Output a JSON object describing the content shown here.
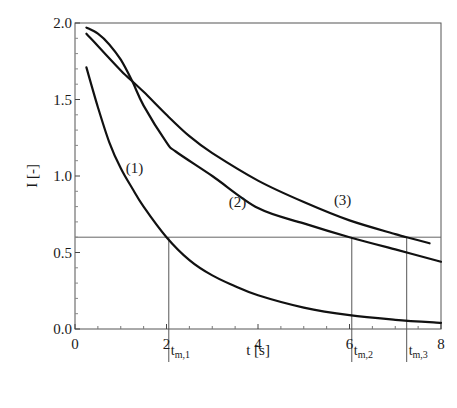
{
  "chart_data": {
    "type": "line",
    "title": "",
    "xlabel": "t [s]",
    "ylabel": "I [-]",
    "xlim": [
      0,
      8
    ],
    "ylim": [
      0,
      2.0
    ],
    "x_ticks": [
      "0",
      "2",
      "4",
      "6",
      "8"
    ],
    "y_ticks": [
      "0.0",
      "0.5",
      "1.0",
      "1.5",
      "2.0"
    ],
    "grid": false,
    "legend": "inline curve labels",
    "series": [
      {
        "name": "(1)",
        "x": [
          0.25,
          0.5,
          0.75,
          1.0,
          1.25,
          1.5,
          2.0,
          2.5,
          3.0,
          3.5,
          4.0,
          5.0,
          6.0,
          7.0,
          8.0
        ],
        "y": [
          1.71,
          1.45,
          1.22,
          1.05,
          0.92,
          0.8,
          0.6,
          0.45,
          0.35,
          0.28,
          0.22,
          0.14,
          0.09,
          0.06,
          0.04
        ]
      },
      {
        "name": "(2)",
        "x": [
          0.25,
          0.5,
          0.75,
          1.0,
          1.25,
          1.5,
          2.0,
          2.2,
          3.0,
          4.0,
          5.0,
          6.0,
          7.0,
          8.0
        ],
        "y": [
          1.97,
          1.93,
          1.86,
          1.76,
          1.62,
          1.46,
          1.22,
          1.16,
          1.0,
          0.79,
          0.69,
          0.6,
          0.52,
          0.44
        ]
      },
      {
        "name": "(3)",
        "x": [
          0.25,
          0.5,
          1.0,
          1.14,
          1.5,
          2.0,
          2.5,
          3.0,
          4.0,
          5.0,
          6.0,
          7.0,
          7.25,
          7.75
        ],
        "y": [
          1.93,
          1.85,
          1.69,
          1.65,
          1.55,
          1.4,
          1.26,
          1.15,
          0.97,
          0.83,
          0.71,
          0.62,
          0.6,
          0.56
        ]
      }
    ],
    "reference_line": {
      "y": 0.6,
      "orientation": "horizontal"
    },
    "markers": [
      {
        "label": "t",
        "sub": "m,1",
        "x": 2.05
      },
      {
        "label": "t",
        "sub": "m,2",
        "x": 6.05
      },
      {
        "label": "t",
        "sub": "m,3",
        "x": 7.25
      }
    ],
    "annotations": [
      {
        "text": "(1)",
        "x": 1.3,
        "y": 1.02
      },
      {
        "text": "(2)",
        "x": 3.55,
        "y": 0.8
      },
      {
        "text": "(3)",
        "x": 5.85,
        "y": 0.81
      }
    ]
  }
}
